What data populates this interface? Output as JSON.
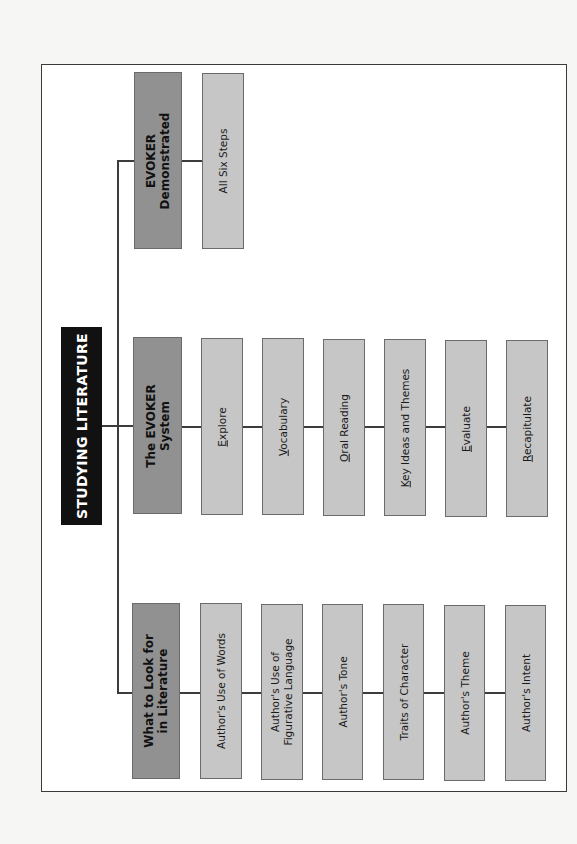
{
  "title": "STUDYING LITERATURE",
  "branches": [
    {
      "heading_line1": "EVOKER",
      "heading_line2": "Demonstrated",
      "children": [
        {
          "label": "All Six Steps"
        }
      ]
    },
    {
      "heading_line1": "The EVOKER",
      "heading_line2": "System",
      "children": [
        {
          "first": "E",
          "rest": "xplore"
        },
        {
          "first": "V",
          "rest": "ocabulary"
        },
        {
          "first": "O",
          "rest": "ral Reading"
        },
        {
          "first": "K",
          "rest": "ey Ideas and Themes"
        },
        {
          "first": "E",
          "rest": "valuate"
        },
        {
          "first": "R",
          "rest": "ecapitulate"
        }
      ]
    },
    {
      "heading_line1": "What to Look for",
      "heading_line2": "in Literature",
      "children": [
        {
          "label": "Author's Use of Words"
        },
        {
          "label_line1": "Author's Use of",
          "label_line2": "Figurative Language"
        },
        {
          "label": "Author's Tone"
        },
        {
          "label": "Traits of Character"
        },
        {
          "label": "Author's Theme"
        },
        {
          "label": "Author's Intent"
        }
      ]
    }
  ],
  "colors": {
    "title_bg": "#111111",
    "heading_bg": "#919191",
    "child_bg": "#c6c6c6",
    "border": "#6b6b6b",
    "connector": "#3c3c3c"
  }
}
